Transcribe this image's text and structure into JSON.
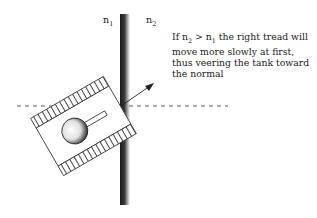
{
  "diagram": {
    "labels": {
      "n1": {
        "base": "n",
        "sub": "1"
      },
      "n2": {
        "base": "n",
        "sub": "2"
      }
    },
    "note": {
      "prefix": "If n",
      "sub_a": "2",
      "mid": " > n",
      "sub_b": "1",
      "suffix": " the right tread will move more slowly at first, thus veering the tank toward the normal"
    },
    "elements": [
      "interface-boundary",
      "normal-dashed-line",
      "direction-arrow",
      "tank"
    ],
    "colors": {
      "ink": "#222222",
      "boundary_dark": "#1a1a1a",
      "background": "#ffffff"
    }
  }
}
